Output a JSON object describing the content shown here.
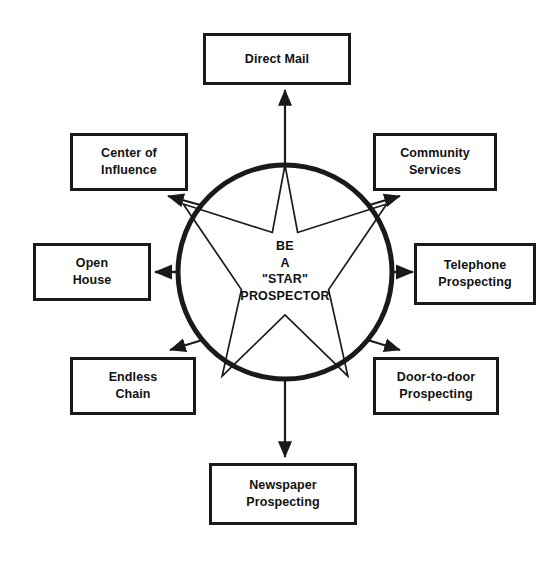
{
  "diagram": {
    "title": "BE A \"STAR\" PROSPECTOR",
    "center": {
      "text": "BE\nA\n\"STAR\"\nPROSPECTOR",
      "shape": "circle-with-five-pointed-star",
      "stroke_color": "#1a1a1a",
      "fill_color": "#ffffff",
      "circle": {
        "cx": 285,
        "cy": 272,
        "r": 107,
        "stroke_width": 5
      },
      "star": {
        "cx": 285,
        "cy": 272,
        "outer_r": 107,
        "inner_r": 43,
        "points": 5,
        "stroke_width": 1.6
      }
    },
    "nodes": [
      {
        "id": "direct-mail",
        "label": "Direct Mail",
        "position": "top",
        "box": {
          "x": 203,
          "y": 33,
          "w": 148,
          "h": 52
        },
        "arrow": {
          "from": [
            285,
            165
          ],
          "to": [
            285,
            88
          ],
          "direction": "up",
          "style": "straight"
        }
      },
      {
        "id": "center-of-influence",
        "label": "Center of\nInfluence",
        "position": "top-left",
        "box": {
          "x": 70,
          "y": 133,
          "w": 118,
          "h": 58
        },
        "arrow": {
          "from": [
            213,
            203
          ],
          "to": [
            165,
            203
          ],
          "direction": "up-left",
          "style": "diagonal"
        }
      },
      {
        "id": "community-services",
        "label": "Community\nServices",
        "position": "top-right",
        "box": {
          "x": 373,
          "y": 133,
          "w": 124,
          "h": 58
        },
        "arrow": {
          "from": [
            357,
            203
          ],
          "to": [
            400,
            199
          ],
          "direction": "up-right",
          "style": "diagonal"
        }
      },
      {
        "id": "open-house",
        "label": "Open\nHouse",
        "position": "left",
        "box": {
          "x": 33,
          "y": 243,
          "w": 118,
          "h": 58
        },
        "arrow": {
          "from": [
            178,
            272
          ],
          "to": [
            154,
            272
          ],
          "direction": "left",
          "style": "straight"
        }
      },
      {
        "id": "telephone-prospecting",
        "label": "Telephone\nProspecting",
        "position": "right",
        "box": {
          "x": 414,
          "y": 243,
          "w": 122,
          "h": 62
        },
        "arrow": {
          "from": [
            392,
            272
          ],
          "to": [
            417,
            272
          ],
          "direction": "right",
          "style": "straight"
        }
      },
      {
        "id": "endless-chain",
        "label": "Endless\nChain",
        "position": "bottom-left",
        "box": {
          "x": 70,
          "y": 357,
          "w": 126,
          "h": 58
        },
        "arrow": {
          "from": [
            213,
            341
          ],
          "to": [
            168,
            345
          ],
          "direction": "down-left",
          "style": "diagonal"
        }
      },
      {
        "id": "door-to-door-prospecting",
        "label": "Door-to-door\nProspecting",
        "position": "bottom-right",
        "box": {
          "x": 373,
          "y": 357,
          "w": 126,
          "h": 58
        },
        "arrow": {
          "from": [
            357,
            341
          ],
          "to": [
            400,
            347
          ],
          "direction": "down-right",
          "style": "diagonal"
        }
      },
      {
        "id": "newspaper-prospecting",
        "label": "Newspaper\nProspecting",
        "position": "bottom",
        "box": {
          "x": 209,
          "y": 463,
          "w": 148,
          "h": 62
        },
        "arrow": {
          "from": [
            285,
            381
          ],
          "to": [
            285,
            458
          ],
          "direction": "down",
          "style": "straight"
        }
      }
    ]
  }
}
